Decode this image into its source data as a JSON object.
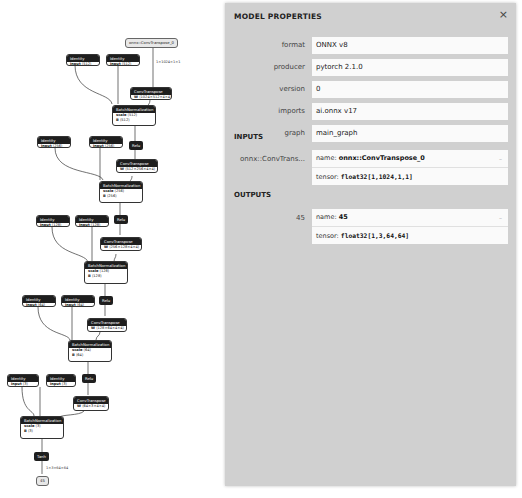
{
  "graph": {
    "input": {
      "label": "onnx::ConvTranspose_0",
      "shape": "1×1024×1×1"
    },
    "blocks": [
      {
        "identity_a": {
          "title": "Identity",
          "attr": "input",
          "val": "⟨512⟩"
        },
        "identity_b": {
          "title": "Identity",
          "attr": "input",
          "val": "⟨512⟩"
        },
        "conv": {
          "title": "ConvTranspose",
          "attr": "W",
          "val": "⟨1024×512×4×4⟩"
        },
        "bn": {
          "title": "BatchNormalization",
          "scale_attr": "scale",
          "scale": "⟨512⟩",
          "b_attr": "B",
          "b": "⟨512⟩"
        },
        "act": "Relu"
      },
      {
        "identity_a": {
          "title": "Identity",
          "attr": "input",
          "val": "⟨256⟩"
        },
        "identity_b": {
          "title": "Identity",
          "attr": "input",
          "val": "⟨256⟩"
        },
        "conv": {
          "title": "ConvTranspose",
          "attr": "W",
          "val": "⟨512×256×4×4⟩"
        },
        "bn": {
          "title": "BatchNormalization",
          "scale_attr": "scale",
          "scale": "⟨256⟩",
          "b_attr": "B",
          "b": "⟨256⟩"
        },
        "act": "Relu"
      },
      {
        "identity_a": {
          "title": "Identity",
          "attr": "input",
          "val": "⟨128⟩"
        },
        "identity_b": {
          "title": "Identity",
          "attr": "input",
          "val": "⟨128⟩"
        },
        "conv": {
          "title": "ConvTranspose",
          "attr": "W",
          "val": "⟨256×128×4×4⟩"
        },
        "bn": {
          "title": "BatchNormalization",
          "scale_attr": "scale",
          "scale": "⟨128⟩",
          "b_attr": "B",
          "b": "⟨128⟩"
        },
        "act": "Relu"
      },
      {
        "identity_a": {
          "title": "Identity",
          "attr": "input",
          "val": "⟨64⟩"
        },
        "identity_b": {
          "title": "Identity",
          "attr": "input",
          "val": "⟨64⟩"
        },
        "conv": {
          "title": "ConvTranspose",
          "attr": "W",
          "val": "⟨128×64×4×4⟩"
        },
        "bn": {
          "title": "BatchNormalization",
          "scale_attr": "scale",
          "scale": "⟨64⟩",
          "b_attr": "B",
          "b": "⟨64⟩"
        },
        "act": "Relu"
      },
      {
        "identity_a": {
          "title": "Identity",
          "attr": "input",
          "val": "⟨3⟩"
        },
        "identity_b": {
          "title": "Identity",
          "attr": "input",
          "val": "⟨3⟩"
        },
        "conv": {
          "title": "ConvTranspose",
          "attr": "W",
          "val": "⟨64×3×4×4⟩"
        },
        "bn": {
          "title": "BatchNormalization",
          "scale_attr": "scale",
          "scale": "⟨3⟩",
          "b_attr": "B",
          "b": "⟨3⟩"
        },
        "act": "Tanh"
      }
    ],
    "output": {
      "label": "45",
      "shape": "1×3×64×64"
    }
  },
  "panel": {
    "title": "MODEL PROPERTIES",
    "close_icon": "×",
    "properties": [
      {
        "label": "format",
        "value": "ONNX v8"
      },
      {
        "label": "producer",
        "value": "pytorch 2.1.0"
      },
      {
        "label": "version",
        "value": "0"
      },
      {
        "label": "imports",
        "value": "ai.onnx v17"
      },
      {
        "label": "graph",
        "value": "main_graph"
      }
    ],
    "inputs_title": "INPUTS",
    "inputs": [
      {
        "label": "onnx::ConvTrans...",
        "name_prefix": "name: ",
        "name": "onnx::ConvTranspose_0",
        "tensor_prefix": "tensor: ",
        "tensor": "float32[1,1024,1,1]"
      }
    ],
    "outputs_title": "OUTPUTS",
    "outputs": [
      {
        "label": "45",
        "name_prefix": "name: ",
        "name": "45",
        "tensor_prefix": "tensor: ",
        "tensor": "float32[1,3,64,64]"
      }
    ]
  },
  "colors": {
    "panel_bg": "#d0d0d0",
    "node_header": "#1e1e1e",
    "value_bg": "#fafafa"
  }
}
